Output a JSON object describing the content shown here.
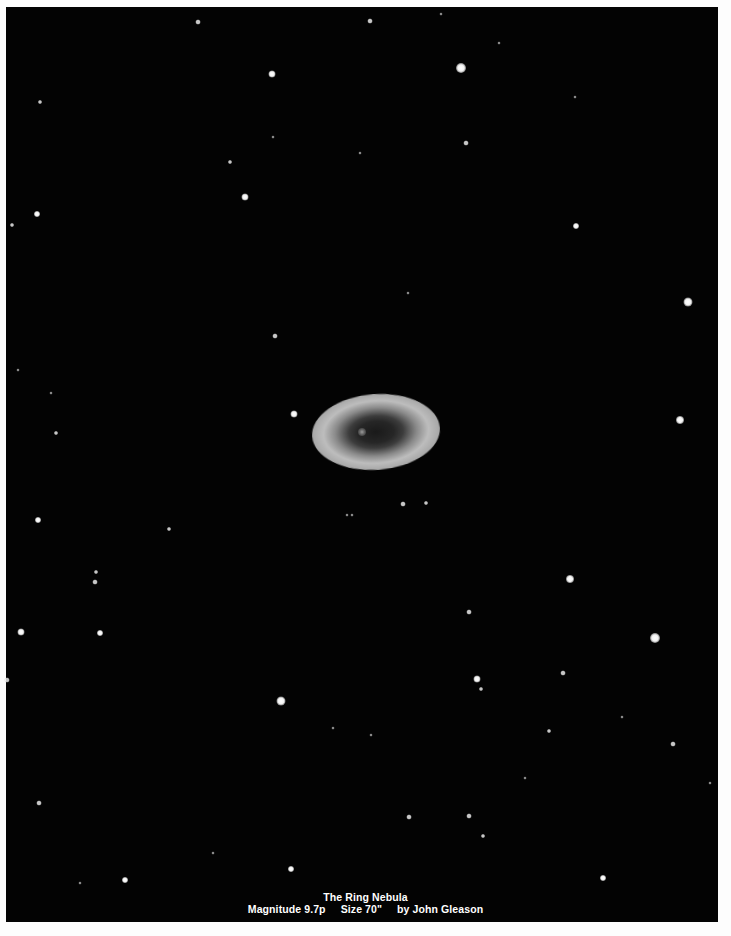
{
  "image": {
    "subject": "Ring Nebula astrophotograph / drawing",
    "background_color": "#030303",
    "frame_color": "#fdfdfd"
  },
  "caption": {
    "title": "The Ring Nebula",
    "magnitude": "Magnitude 9.7p",
    "size": "Size 70\"",
    "credit": "by John Gleason"
  },
  "nebula": {
    "cx": 362,
    "cy": 432,
    "width": 128,
    "height": 76
  },
  "stars": [
    [
      198,
      22,
      5
    ],
    [
      370,
      21,
      5
    ],
    [
      441,
      14,
      3
    ],
    [
      499,
      43,
      3
    ],
    [
      272,
      74,
      7
    ],
    [
      461,
      68,
      10
    ],
    [
      40,
      102,
      4
    ],
    [
      575,
      97,
      3
    ],
    [
      466,
      143,
      5
    ],
    [
      230,
      162,
      4
    ],
    [
      273,
      137,
      3
    ],
    [
      360,
      153,
      3
    ],
    [
      245,
      197,
      7
    ],
    [
      37,
      214,
      6
    ],
    [
      12,
      225,
      4
    ],
    [
      576,
      226,
      6
    ],
    [
      688,
      302,
      9
    ],
    [
      408,
      293,
      3
    ],
    [
      275,
      336,
      5
    ],
    [
      18,
      370,
      3
    ],
    [
      51,
      393,
      3
    ],
    [
      294,
      414,
      7
    ],
    [
      680,
      420,
      8
    ],
    [
      56,
      433,
      4
    ],
    [
      423,
      453,
      3
    ],
    [
      403,
      504,
      5
    ],
    [
      426,
      503,
      4
    ],
    [
      347,
      515,
      3
    ],
    [
      352,
      515,
      3
    ],
    [
      38,
      520,
      6
    ],
    [
      169,
      529,
      4
    ],
    [
      570,
      579,
      8
    ],
    [
      96,
      572,
      4
    ],
    [
      95,
      582,
      5
    ],
    [
      469,
      612,
      5
    ],
    [
      21,
      632,
      7
    ],
    [
      100,
      633,
      6
    ],
    [
      655,
      638,
      10
    ],
    [
      7,
      680,
      5
    ],
    [
      281,
      701,
      9
    ],
    [
      477,
      679,
      7
    ],
    [
      481,
      689,
      4
    ],
    [
      563,
      673,
      5
    ],
    [
      622,
      717,
      3
    ],
    [
      333,
      728,
      3
    ],
    [
      549,
      731,
      4
    ],
    [
      673,
      744,
      5
    ],
    [
      371,
      735,
      3
    ],
    [
      39,
      803,
      5
    ],
    [
      409,
      817,
      5
    ],
    [
      469,
      816,
      5
    ],
    [
      483,
      836,
      4
    ],
    [
      710,
      783,
      3
    ],
    [
      525,
      778,
      3
    ],
    [
      291,
      869,
      6
    ],
    [
      603,
      878,
      6
    ],
    [
      125,
      880,
      6
    ],
    [
      80,
      883,
      3
    ],
    [
      213,
      853,
      3
    ]
  ]
}
